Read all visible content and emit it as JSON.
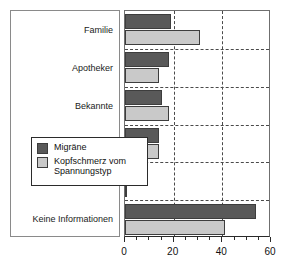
{
  "chart_data": {
    "type": "bar",
    "orientation": "horizontal",
    "title": "",
    "xlabel": "",
    "ylabel": "",
    "xlim": [
      0,
      60
    ],
    "xticks": [
      0,
      20,
      40,
      60
    ],
    "xtick_labels": [
      "0",
      "20",
      "40",
      "60"
    ],
    "minor_tick_step": 5,
    "grid": true,
    "grid_style": "dashed",
    "grid_axis": "both",
    "legend_position": "center-right-inside",
    "categories": [
      "Familie",
      "Apotheker",
      "Bekannte",
      "Presse",
      "Andere Quellen",
      "Keine Informationen"
    ],
    "series": [
      {
        "name": "Migräne",
        "color": "#595959",
        "values": [
          19,
          18,
          15,
          14,
          2,
          54
        ]
      },
      {
        "name": "Kopfschmerz vom Spannungstyp",
        "color": "#c9c9c9",
        "values": [
          31,
          14,
          18,
          14,
          1,
          41
        ]
      }
    ]
  },
  "legend": {
    "entries": [
      {
        "label": "Migräne"
      },
      {
        "label": "Kopfschmerz vom Spannungstyp"
      }
    ]
  }
}
